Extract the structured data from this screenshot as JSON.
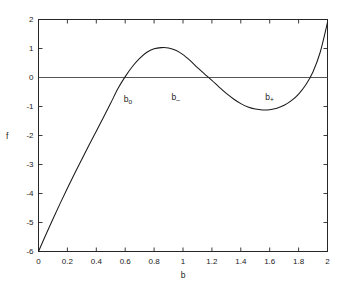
{
  "chart_data": {
    "type": "line",
    "title": "",
    "xlabel": "b",
    "ylabel": "f",
    "xlim": [
      0,
      2
    ],
    "ylim": [
      -6,
      2
    ],
    "grid": false,
    "legend": null,
    "xticks": [
      0,
      0.2,
      0.4,
      0.6,
      0.8,
      1,
      1.2,
      1.4,
      1.6,
      1.8,
      2
    ],
    "xticklabels": [
      "0",
      "0.2",
      "0.4",
      "0.6",
      "0.8",
      "1",
      "1.2",
      "1.4",
      "1.6",
      "1.8",
      "2"
    ],
    "yticks": [
      -6,
      -5,
      -4,
      -3,
      -2,
      -1,
      0,
      1,
      2
    ],
    "yticklabels": [
      "-6",
      "-5",
      "-4",
      "-3",
      "-2",
      "-1",
      "0",
      "1",
      "2"
    ],
    "series": [
      {
        "name": "f(b)",
        "color": "#1a1a1a",
        "x": [
          0.0,
          0.05,
          0.1,
          0.15,
          0.2,
          0.25,
          0.3,
          0.35,
          0.4,
          0.45,
          0.5,
          0.55,
          0.6,
          0.65,
          0.7,
          0.75,
          0.8,
          0.85,
          0.9,
          0.95,
          1.0,
          1.05,
          1.1,
          1.15,
          1.2,
          1.25,
          1.3,
          1.35,
          1.4,
          1.45,
          1.5,
          1.55,
          1.6,
          1.65,
          1.7,
          1.75,
          1.8,
          1.85,
          1.9,
          1.95,
          2.0
        ],
        "y": [
          -6.0,
          -5.43,
          -4.88,
          -4.34,
          -3.82,
          -3.31,
          -2.82,
          -2.33,
          -1.85,
          -1.37,
          -0.88,
          -0.38,
          0.03,
          0.38,
          0.66,
          0.87,
          0.99,
          1.03,
          1.02,
          0.94,
          0.79,
          0.58,
          0.34,
          0.12,
          -0.1,
          -0.33,
          -0.55,
          -0.74,
          -0.9,
          -1.02,
          -1.09,
          -1.12,
          -1.11,
          -1.06,
          -0.96,
          -0.8,
          -0.57,
          -0.25,
          0.2,
          0.88,
          1.9
        ]
      },
      {
        "name": "zero-line",
        "color": "#555555",
        "x": [
          0,
          2
        ],
        "y": [
          0,
          0
        ]
      }
    ],
    "annotations": [
      {
        "id": "b-zero",
        "base": "b",
        "sub": "o",
        "x": 0.59,
        "y": -0.62
      },
      {
        "id": "b-minus",
        "base": "b",
        "sub": "–",
        "x": 0.92,
        "y": -0.55
      },
      {
        "id": "b-plus",
        "base": "b",
        "sub": "+",
        "x": 1.57,
        "y": -0.55
      }
    ]
  },
  "axis": {
    "x_title": "b",
    "y_title": "f"
  },
  "xticklabels": [
    "0",
    "0.2",
    "0.4",
    "0.6",
    "0.8",
    "1",
    "1.2",
    "1.4",
    "1.6",
    "1.8",
    "2"
  ],
  "yticklabels": [
    "2",
    "1",
    "0",
    "-1",
    "-2",
    "-3",
    "-4",
    "-5",
    "-6"
  ],
  "annotation_labels": {
    "b_zero_base": "b",
    "b_zero_sub": "o",
    "b_minus_base": "b",
    "b_minus_sub": "–",
    "b_plus_base": "b",
    "b_plus_sub": "+"
  }
}
